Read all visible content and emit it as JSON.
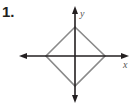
{
  "problem": {
    "number": "1."
  },
  "axes": {
    "x_label": "x",
    "y_label": "y",
    "color": "#231f20"
  },
  "shape": {
    "type": "square rotated 45° (diamond)",
    "color": "#8a8a8a",
    "vertices_px": [
      [
        75,
        27
      ],
      [
        105,
        56
      ],
      [
        75,
        86
      ],
      [
        46,
        56
      ]
    ]
  }
}
